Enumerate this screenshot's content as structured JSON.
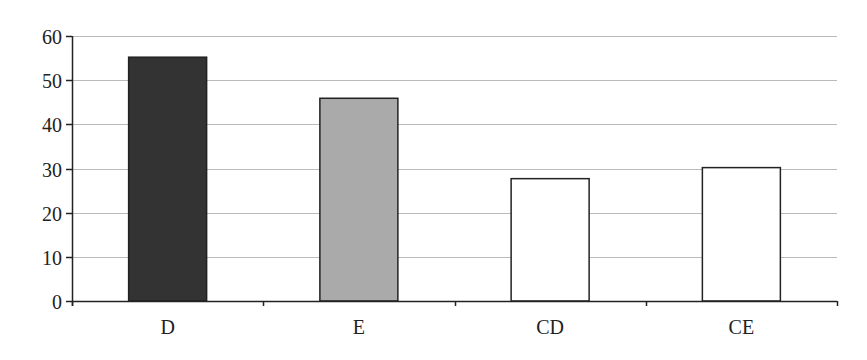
{
  "chart_data": {
    "type": "bar",
    "title": "",
    "xlabel": "",
    "ylabel": "",
    "categories": [
      "D",
      "E",
      "CD",
      "CE"
    ],
    "values": [
      55.2,
      45.9,
      27.7,
      30.2
    ],
    "bar_colors": [
      "#333333",
      "#aaaaaa",
      "#ffffff",
      "#ffffff"
    ],
    "bar_edge_color": "#222222",
    "ylim": [
      0,
      60
    ],
    "yticks": [
      0,
      10,
      20,
      30,
      40,
      50,
      60
    ],
    "grid": true,
    "grid_color": "#bbbbbb",
    "legend": null
  }
}
